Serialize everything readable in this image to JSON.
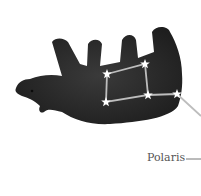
{
  "figure": {
    "label": "Polaris",
    "label_dash": "—",
    "colors": {
      "bear": "#2a2a2a",
      "star": "#ffffff",
      "line": "#bdbdbd",
      "text": "#555555"
    },
    "stars": [
      {
        "x": 107,
        "y": 74
      },
      {
        "x": 145,
        "y": 64
      },
      {
        "x": 106,
        "y": 102
      },
      {
        "x": 148,
        "y": 95
      },
      {
        "x": 177,
        "y": 94
      }
    ]
  }
}
